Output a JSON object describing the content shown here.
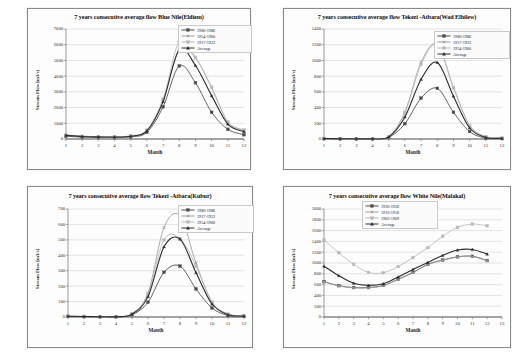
{
  "figure": {
    "background": "#ffffff",
    "panel_border": "#8a8a8a"
  },
  "series_colors": {
    "s1": "#4a4a4a",
    "s2": "#9d9d9d",
    "s3": "#b9b9b9",
    "avg": "#2e2e2e"
  },
  "axis_label_x": "Month",
  "axis_label_y": "Stream Flow [m3/s]",
  "charts": [
    {
      "id": "blue-nile-eldiem",
      "title": "7 years consecutive average flow Blue Nile(Eldiem)",
      "xlabel": "Month",
      "ylabel": "Stream Flow [m3/s]",
      "xticks": [
        "1",
        "2",
        "3",
        "4",
        "5",
        "6",
        "7",
        "8",
        "9",
        "10",
        "11",
        "12"
      ],
      "yticks": [
        "0",
        "1000",
        "2000",
        "3000",
        "4000",
        "5000",
        "6000",
        "7000"
      ],
      "ylim": [
        0,
        7000
      ],
      "xlim": [
        1,
        12
      ],
      "legend": [
        "1980-1986",
        "1954-1960",
        "1917-1923",
        "Average"
      ],
      "chart_data": {
        "type": "line",
        "title": "7 years consecutive average flow Blue Nile(Eldiem)",
        "xlabel": "Month",
        "ylabel": "Stream Flow [m3/s]",
        "ylim": [
          0,
          7000
        ],
        "grid": true,
        "legend_position": "top-right",
        "categories": [
          1,
          2,
          3,
          4,
          5,
          6,
          7,
          8,
          9,
          10,
          11,
          12
        ],
        "series": [
          {
            "name": "1980-1986",
            "values": [
              180,
              120,
              100,
              95,
              140,
              430,
              2050,
              4650,
              3580,
              1700,
              620,
              270
            ]
          },
          {
            "name": "1954-1960",
            "values": [
              260,
              180,
              150,
              140,
              200,
              560,
              2500,
              5700,
              5150,
              3250,
              1080,
              560
            ]
          },
          {
            "name": "1917-1923",
            "values": [
              250,
              175,
              150,
              140,
              200,
              560,
              2520,
              6200,
              5200,
              3300,
              1100,
              570
            ]
          },
          {
            "name": "Average",
            "values": [
              230,
              160,
              135,
              125,
              180,
              520,
              2380,
              5680,
              4680,
              2760,
              950,
              470
            ]
          }
        ]
      }
    },
    {
      "id": "tekezi-atbara-wad-elhilew",
      "title": "7 years consecutive average flow Tekezi -Atbara(Wad Elhilew)",
      "xlabel": "Month",
      "ylabel": "Stream Flow [m3/s]",
      "xticks": [
        "1",
        "2",
        "3",
        "4",
        "5",
        "6",
        "7",
        "8",
        "9",
        "10",
        "11",
        "12"
      ],
      "yticks": [
        "0",
        "200",
        "400",
        "600",
        "800",
        "1000",
        "1200",
        "1400"
      ],
      "ylim": [
        0,
        1400
      ],
      "xlim": [
        1,
        12
      ],
      "legend": [
        "1980-1986",
        "1917-1923",
        "1954-1960",
        "Average"
      ],
      "chart_data": {
        "type": "line",
        "title": "7 years consecutive average flow Tekezi -Atbara(Wad Elhilew)",
        "xlabel": "Month",
        "ylabel": "Stream Flow [m3/s]",
        "ylim": [
          0,
          1400
        ],
        "grid": true,
        "legend_position": "top-right",
        "categories": [
          1,
          2,
          3,
          4,
          5,
          6,
          7,
          8,
          9,
          10,
          11,
          12
        ],
        "series": [
          {
            "name": "1980-1986",
            "values": [
              5,
              3,
              2,
              2,
              20,
              195,
              520,
              645,
              340,
              95,
              12,
              6
            ]
          },
          {
            "name": "1917-1923",
            "values": [
              8,
              5,
              4,
              4,
              30,
              345,
              975,
              1205,
              660,
              175,
              30,
              12
            ]
          },
          {
            "name": "1954-1960",
            "values": [
              7,
              5,
              4,
              4,
              28,
              330,
              950,
              1190,
              650,
              170,
              28,
              11
            ]
          },
          {
            "name": "Average",
            "values": [
              6,
              4,
              3,
              3,
              25,
              280,
              760,
              975,
              545,
              140,
              20,
              9
            ]
          }
        ]
      }
    },
    {
      "id": "tekezi-atbara-kubur",
      "title": "7 years consecutive average flow Tekezi -Atbara(Kubur)",
      "xlabel": "Month",
      "ylabel": "Stream Flow [m3/s]",
      "xticks": [
        "1",
        "2",
        "3",
        "4",
        "5",
        "6",
        "7",
        "8",
        "9",
        "10",
        "11",
        "12"
      ],
      "yticks": [
        "0",
        "100",
        "200",
        "300",
        "400",
        "500",
        "600",
        "700"
      ],
      "ylim": [
        0,
        700
      ],
      "xlim": [
        1,
        12
      ],
      "legend": [
        "1980-1986",
        "1917-1923",
        "1954-1960",
        "Average"
      ],
      "chart_data": {
        "type": "line",
        "title": "7 years consecutive average flow Tekezi -Atbara(Kubur)",
        "xlabel": "Month",
        "ylabel": "Stream Flow [m3/s]",
        "ylim": [
          0,
          700
        ],
        "grid": true,
        "legend_position": "top-right",
        "categories": [
          1,
          2,
          3,
          4,
          5,
          6,
          7,
          8,
          9,
          10,
          11,
          12
        ],
        "series": [
          {
            "name": "1980-1986",
            "values": [
              4,
              3,
              2,
              2,
              14,
              96,
              290,
              330,
              182,
              58,
              10,
              5
            ]
          },
          {
            "name": "1917-1923",
            "values": [
              6,
              4,
              3,
              3,
              22,
              155,
              580,
              655,
              350,
              98,
              20,
              8
            ]
          },
          {
            "name": "1954-1960",
            "values": [
              6,
              4,
              3,
              3,
              20,
              150,
              500,
              508,
              330,
              95,
              18,
              7
            ]
          },
          {
            "name": "Average",
            "values": [
              5,
              3,
              2,
              2,
              18,
              132,
              455,
              505,
              288,
              84,
              15,
              6
            ]
          }
        ]
      }
    },
    {
      "id": "white-nile-malakal",
      "title": "7 years consecutive average flow White Nile(Malakal)",
      "xlabel": "Month",
      "ylabel": "Stream Flow [m3/s]",
      "xticks": [
        "1",
        "2",
        "3",
        "4",
        "5",
        "6",
        "7",
        "8",
        "9",
        "10",
        "11",
        "12",
        "13"
      ],
      "yticks": [
        "0",
        "200",
        "400",
        "600",
        "800",
        "1000",
        "1200",
        "1400",
        "1600",
        "1800",
        "2000"
      ],
      "ylim": [
        0,
        2000
      ],
      "xlim": [
        1,
        13
      ],
      "legend": [
        "1920-1926",
        "1910-1916",
        "1963-1969",
        "Average"
      ],
      "chart_data": {
        "type": "line",
        "title": "7 years consecutive average flow White Nile(Malakal)",
        "xlabel": "Month",
        "ylabel": "Stream Flow [m3/s]",
        "ylim": [
          0,
          2000
        ],
        "grid": true,
        "legend_position": "top-center",
        "categories": [
          1,
          2,
          3,
          4,
          5,
          6,
          7,
          8,
          9,
          10,
          11,
          12
        ],
        "series": [
          {
            "name": "1920-1926",
            "values": [
              655,
              580,
              545,
              545,
              585,
              700,
              825,
              975,
              1055,
              1115,
              1125,
              1045
            ]
          },
          {
            "name": "1910-1916",
            "values": [
              650,
              575,
              540,
              540,
              580,
              695,
              820,
              970,
              1050,
              1110,
              1120,
              1040
            ]
          },
          {
            "name": "1963-1969",
            "values": [
              1425,
              1190,
              975,
              825,
              820,
              935,
              1100,
              1285,
              1495,
              1660,
              1720,
              1690
            ]
          },
          {
            "name": "Average",
            "values": [
              940,
              765,
              625,
              585,
              615,
              740,
              880,
              1010,
              1140,
              1240,
              1250,
              1165
            ]
          }
        ]
      }
    }
  ]
}
